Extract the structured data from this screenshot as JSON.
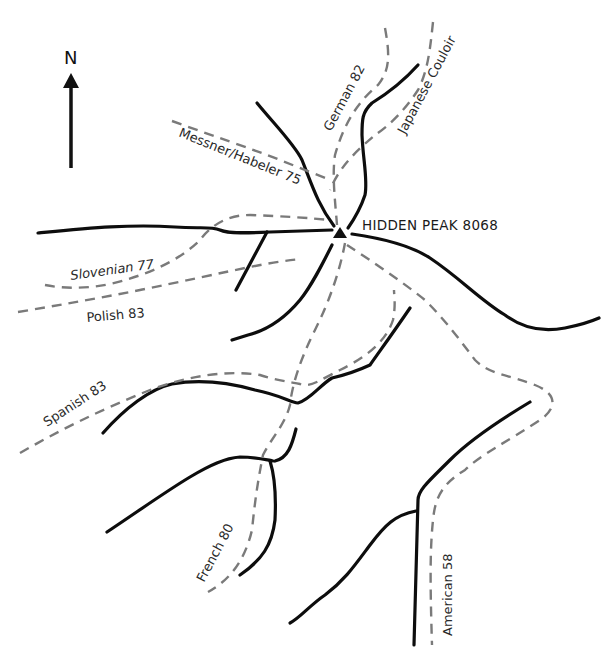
{
  "map": {
    "north_label": "N",
    "peak": {
      "name": "HIDDEN PEAK 8068",
      "icon": "triangle-summit-icon"
    },
    "routes": [
      {
        "id": "messner-habeler",
        "label": "Messner/Habeler 75"
      },
      {
        "id": "german",
        "label": "German 82"
      },
      {
        "id": "japanese",
        "label": "Japanese Couloir"
      },
      {
        "id": "slovenian",
        "label": "Slovenian 77"
      },
      {
        "id": "polish",
        "label": "Polish 83"
      },
      {
        "id": "spanish",
        "label": "Spanish 83"
      },
      {
        "id": "french",
        "label": "French 80"
      },
      {
        "id": "american",
        "label": "American 58"
      }
    ],
    "legend": {
      "ridge_style": "solid black line",
      "route_style": "dashed grey line"
    },
    "colors": {
      "ridge": "#0d0d0d",
      "route": "#7a7a7a",
      "background": "#ffffff"
    }
  }
}
